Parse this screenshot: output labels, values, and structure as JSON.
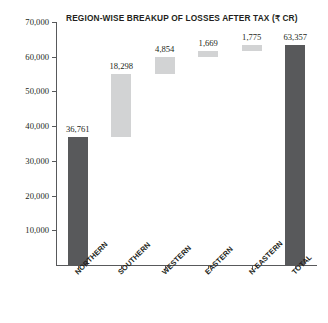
{
  "chart_data": {
    "type": "bar",
    "subtype": "waterfall",
    "title": "REGION-WISE BREAKUP OF LOSSES AFTER TAX (₹ CR)",
    "xlabel": "",
    "ylabel": "",
    "ylim": [
      0,
      70000
    ],
    "grid": false,
    "legend": "none",
    "categories": [
      "NORTHERN",
      "SOUTHERN",
      "WESTERN",
      "EASTERN",
      "N-EASTERN",
      "TOTAL"
    ],
    "values": [
      36761,
      18298,
      4854,
      1669,
      1775,
      63357
    ],
    "value_labels": [
      "36,761",
      "18,298",
      "4,854",
      "1,669",
      "1,775",
      "63,357"
    ],
    "bar_bases": [
      0,
      36761,
      55059,
      59913,
      61582,
      0
    ],
    "bar_tops": [
      36761,
      55059,
      59913,
      61582,
      63357,
      63357
    ],
    "bar_kinds": [
      "total",
      "delta",
      "delta",
      "delta",
      "delta",
      "total"
    ],
    "ytick_labels": [
      "70,000",
      "60,000",
      "50,000",
      "40,000",
      "30,000",
      "20,000",
      "10,000"
    ],
    "ytick_values": [
      70000,
      60000,
      50000,
      40000,
      30000,
      20000,
      10000
    ],
    "colors": {
      "total_bar": "#58595b",
      "delta_bar": "#d2d3d4",
      "axis": "#58595b",
      "text": "#231f20",
      "background": "#ffffff"
    }
  }
}
